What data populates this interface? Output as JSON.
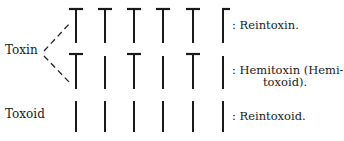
{
  "figure": {
    "left_labels": {
      "toxin": "Toxin",
      "toxoid": "Toxoid"
    },
    "rows": [
      {
        "id": "reintoxin",
        "group": "Toxin",
        "pattern": [
          "T",
          "T",
          "T",
          "T",
          "T",
          "T-half"
        ],
        "caption_lines": [
          ": Reintoxin."
        ]
      },
      {
        "id": "hemitoxin",
        "group": "Toxin",
        "pattern": [
          "T",
          "I",
          "T",
          "I",
          "T",
          "I"
        ],
        "caption_lines": [
          ": Hemitoxin (Hemi-",
          "toxoid)."
        ]
      },
      {
        "id": "reintoxoid",
        "group": "Toxoid",
        "pattern": [
          "I",
          "I",
          "I",
          "I",
          "I",
          "I"
        ],
        "caption_lines": [
          ": Reintoxoid."
        ]
      }
    ],
    "legend_meaning": {
      "T": "receptor group with toxophore cap (toxic)",
      "I": "receptor group without toxophore (toxoid)"
    }
  }
}
